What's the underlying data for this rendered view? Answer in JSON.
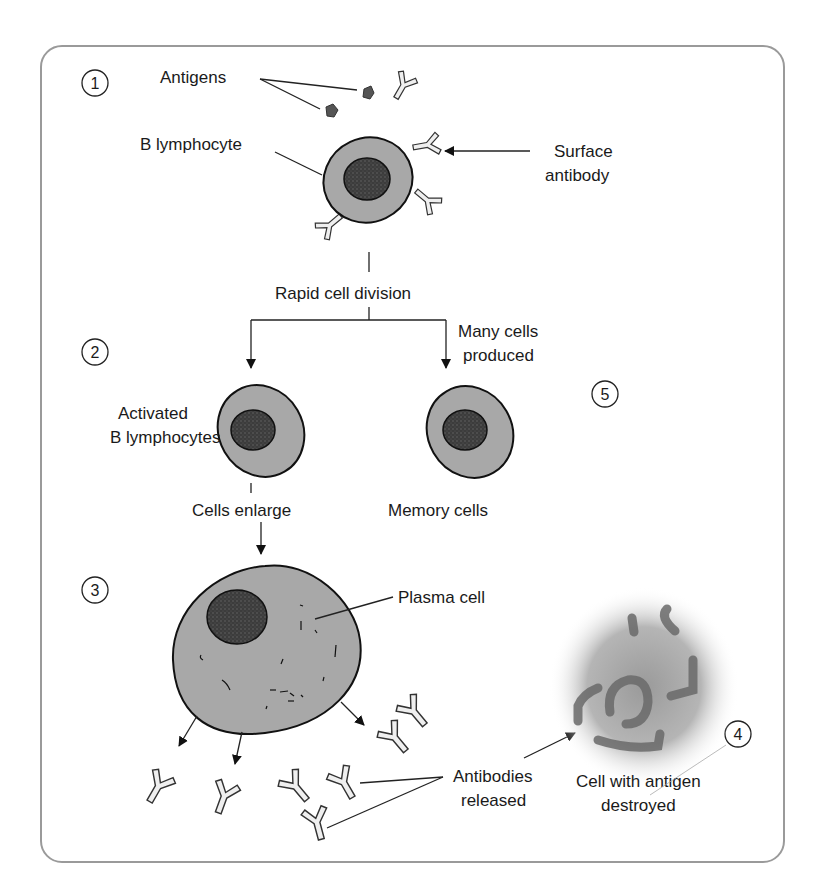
{
  "figure": {
    "steps": [
      {
        "number": "1",
        "label": "Step 1"
      },
      {
        "number": "2",
        "label": "Step 2"
      },
      {
        "number": "3",
        "label": "Step 3"
      },
      {
        "number": "4",
        "label": "Step 4"
      },
      {
        "number": "5",
        "label": "Step 5"
      }
    ],
    "labels": {
      "antigens": "Antigens",
      "b_lymphocyte": "B lymphocyte",
      "surface_antibody_1": "Surface",
      "surface_antibody_2": "antibody",
      "rapid_cell_division": "Rapid cell division",
      "many_cells_1": "Many cells",
      "many_cells_2": "produced",
      "activated_1": "Activated",
      "activated_2": "B lymphocytes",
      "cells_enlarge": "Cells enlarge",
      "memory_cells": "Memory cells",
      "plasma_cell": "Plasma cell",
      "antibodies_1": "Antibodies",
      "antibodies_2": "released",
      "destroyed_1": "Cell with antigen",
      "destroyed_2": "destroyed"
    },
    "colors": {
      "frame": "#9a9a9a",
      "cytoplasm": "#a8a8a8",
      "nucleus": "#3a3a3a",
      "antibody_fill": "#efefef",
      "antigen": "#555555",
      "text": "#1a1a1a"
    }
  }
}
